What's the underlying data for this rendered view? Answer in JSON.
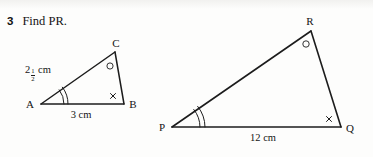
{
  "question": {
    "number": "3",
    "text": "Find PR."
  },
  "figures": [
    {
      "name": "small-triangle",
      "vertices": [
        {
          "label": "A",
          "x": 41,
          "y": 104
        },
        {
          "label": "B",
          "x": 124,
          "y": 104
        },
        {
          "label": "C",
          "x": 115,
          "y": 52
        }
      ],
      "side_labels": [
        {
          "name": "side-ac-label",
          "whole": "2",
          "numerator": "1",
          "denominator": "2",
          "unit": "cm"
        },
        {
          "name": "side-ab-label",
          "text": "3 cm"
        }
      ],
      "angle_marks": [
        {
          "vertex": "A",
          "type": "double-tick"
        },
        {
          "vertex": "B",
          "type": "cross"
        },
        {
          "vertex": "C",
          "type": "circle"
        }
      ]
    },
    {
      "name": "large-triangle",
      "vertices": [
        {
          "label": "P",
          "x": 172,
          "y": 127
        },
        {
          "label": "Q",
          "x": 341,
          "y": 127
        },
        {
          "label": "R",
          "x": 311,
          "y": 31
        }
      ],
      "side_labels": [
        {
          "name": "side-pq-label",
          "text": "12 cm"
        }
      ],
      "angle_marks": [
        {
          "vertex": "P",
          "type": "double-tick"
        },
        {
          "vertex": "Q",
          "type": "cross"
        },
        {
          "vertex": "R",
          "type": "circle"
        }
      ]
    }
  ],
  "labels": {
    "A": "A",
    "B": "B",
    "C": "C",
    "P": "P",
    "Q": "Q",
    "R": "R",
    "side_ab": "3 cm",
    "side_pq": "12 cm",
    "ac_whole": "2",
    "ac_num": "1",
    "ac_den": "2",
    "ac_unit": "cm"
  },
  "colors": {
    "ink": "#1c1c1c",
    "paper": "#fdfdfc"
  }
}
